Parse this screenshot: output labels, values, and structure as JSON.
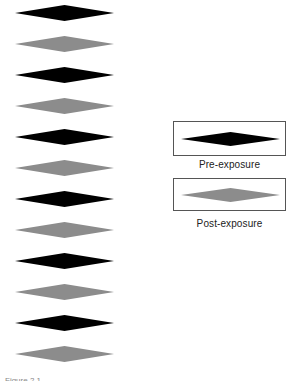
{
  "figure": {
    "stimulus_column": {
      "count": 12,
      "pattern": [
        "pre",
        "post",
        "pre",
        "post",
        "pre",
        "post",
        "pre",
        "post",
        "pre",
        "post",
        "pre",
        "post"
      ],
      "center_y": [
        13,
        44,
        75,
        106,
        137,
        168,
        199,
        230,
        261,
        292,
        323,
        354
      ]
    },
    "colors": {
      "pre": "#000000",
      "post": "#8c8c8c"
    },
    "legend": [
      {
        "key": "pre",
        "label": "Pre-exposure"
      },
      {
        "key": "post",
        "label": "Post-exposure"
      }
    ],
    "caption": "Figure 2.1"
  }
}
